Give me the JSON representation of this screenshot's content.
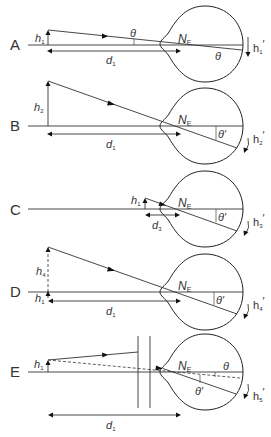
{
  "diagram": {
    "panels": [
      {
        "label": "A",
        "object": "h",
        "object_sub": "1",
        "distance": "d",
        "distance_sub": "1",
        "node": "N",
        "node_sub": "E",
        "angle_outside": "θ",
        "angle_inside": "θ",
        "image": "h",
        "image_sub": "1",
        "image_prime": "′"
      },
      {
        "label": "B",
        "object": "h",
        "object_sub": "2",
        "distance": "d",
        "distance_sub": "1",
        "node": "N",
        "node_sub": "E",
        "angle_inside": "θ′",
        "image": "h",
        "image_sub": "2",
        "image_prime": "′"
      },
      {
        "label": "C",
        "object": "h",
        "object_sub": "1",
        "distance": "d",
        "distance_sub": "3",
        "node": "N",
        "node_sub": "E",
        "angle_inside": "θ′",
        "image": "h",
        "image_sub": "3",
        "image_prime": "′"
      },
      {
        "label": "D",
        "object": "h",
        "object_sub": "4",
        "object2": "h",
        "object2_sub": "1",
        "distance": "d",
        "distance_sub": "1",
        "node": "N",
        "node_sub": "E",
        "angle_inside": "θ′",
        "image": "h",
        "image_sub": "4",
        "image_prime": "′"
      },
      {
        "label": "E",
        "object": "h",
        "object_sub": "1",
        "distance": "d",
        "distance_sub": "1",
        "node": "N",
        "node_sub": "E",
        "angle_a": "θ",
        "angle_b": "θ′",
        "image": "h",
        "image_sub": "5",
        "image_prime": "′"
      }
    ]
  }
}
